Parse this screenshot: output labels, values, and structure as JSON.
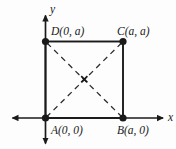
{
  "figure": {
    "type": "coordinate-geometry-diagram",
    "background_color": "#fdfdfd",
    "line_color": "#1a1a1a",
    "axes": {
      "x_label": "x",
      "y_label": "y",
      "origin_label": "A(0, 0)"
    },
    "vertices": [
      {
        "id": "A",
        "label": "A(0, 0)",
        "x": 0,
        "y": 0
      },
      {
        "id": "B",
        "label": "B(a, 0)",
        "x": "a",
        "y": 0
      },
      {
        "id": "C",
        "label": "C(a, a)",
        "x": "a",
        "y": "a"
      },
      {
        "id": "D",
        "label": "D(0, a)",
        "x": 0,
        "y": "a"
      }
    ],
    "diagonals": {
      "style": "dashed",
      "center_marker": "×"
    }
  }
}
